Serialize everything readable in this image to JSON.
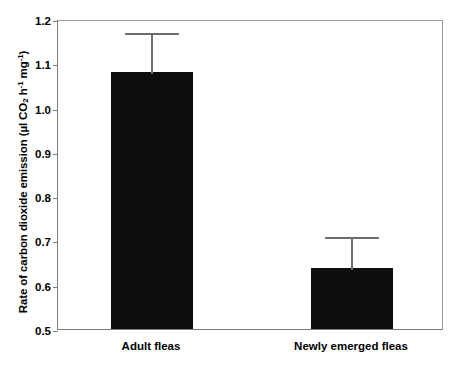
{
  "chart_data": {
    "type": "bar",
    "title": "",
    "xlabel": "",
    "ylabel": "Rate of carbon dioxide emission (µl CO2 h-1 mg-1)",
    "ylabel_parts": {
      "prefix": "Rate of carbon dioxide emission (µl CO",
      "sub": "2",
      "mid": " h",
      "sup1": "-1",
      "mid2": " mg",
      "sup2": "-1",
      "suffix": ")"
    },
    "categories": [
      "Adult fleas",
      "Newly emerged fleas"
    ],
    "values": [
      1.08,
      0.637
    ],
    "errors_upper": [
      0.093,
      0.075
    ],
    "error_tops": [
      1.173,
      0.712
    ],
    "ylim": [
      0.5,
      1.2
    ],
    "ytick_labels": [
      "1.2",
      "1.1",
      "1.0",
      "0.9",
      "0.8",
      "0.7",
      "0.6",
      "0.5"
    ],
    "ytick_values": [
      1.2,
      1.1,
      1.0,
      0.9,
      0.8,
      0.7,
      0.6,
      0.5
    ],
    "grid": false,
    "legend": false,
    "bar_color": "#0d0d0d",
    "error_color": "#6e6e6e",
    "axis_color": "#7d7d7d"
  }
}
